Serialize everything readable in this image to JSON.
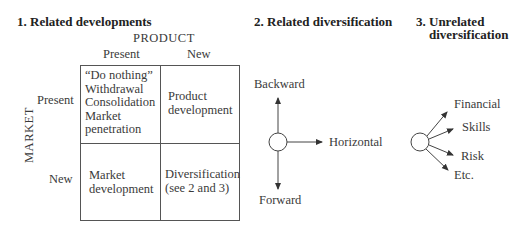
{
  "sections": {
    "related_developments": {
      "title": "1. Related developments",
      "axis_product": "PRODUCT",
      "axis_market": "MARKET",
      "columns": [
        "Present",
        "New"
      ],
      "rows": [
        "Present",
        "New"
      ],
      "cells": {
        "present_present": [
          "“Do nothing”",
          "Withdrawal",
          "Consolidation",
          "Market",
          "penetration"
        ],
        "present_new": [
          "Product",
          "development"
        ],
        "new_present": [
          "Market",
          "development"
        ],
        "new_new": [
          "Diversification",
          "(see 2 and 3)"
        ]
      }
    },
    "related_diversification": {
      "title": "2. Related diversification",
      "directions": {
        "up": "Backward",
        "right": "Horizontal",
        "down": "Forward"
      }
    },
    "unrelated_diversification": {
      "title_line1": "3. Unrelated",
      "title_line2": "diversification",
      "branches": [
        "Financial",
        "Skills",
        "Risk",
        "Etc."
      ]
    }
  }
}
